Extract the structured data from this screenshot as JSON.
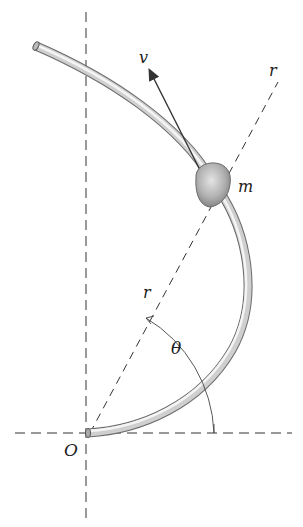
{
  "diagram": {
    "type": "polar-coordinates-bead-on-curved-rod",
    "labels": {
      "velocity": "v",
      "radial_axis_top": "r",
      "radial_distance": "r",
      "mass": "m",
      "angle": "θ",
      "origin": "O"
    },
    "colors": {
      "line": "#333333",
      "rod_light": "#f2f2f2",
      "rod_dark": "#8a8a8a",
      "bead": "#a8a8a8",
      "background": "#ffffff"
    }
  }
}
